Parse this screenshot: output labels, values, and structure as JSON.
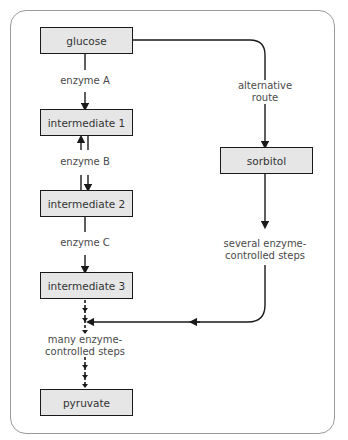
{
  "diagram": {
    "nodes": {
      "glucose": "glucose",
      "intermediate1": "intermediate 1",
      "intermediate2": "intermediate 2",
      "intermediate3": "intermediate 3",
      "pyruvate": "pyruvate",
      "sorbitol": "sorbitol"
    },
    "labels": {
      "enzymeA": "enzyme A",
      "enzymeB": "enzyme B",
      "enzymeC": "enzyme C",
      "alternative_line1": "alternative",
      "alternative_line2": "route",
      "several_line1": "several enzyme-",
      "several_line2": "controlled steps",
      "many_line1": "many enzyme-",
      "many_line2": "controlled steps"
    },
    "colors": {
      "box_fill": "#e6e6e6",
      "box_border": "#1a1a1a",
      "frame_border": "#9a9a9a",
      "text": "#4a4a4a"
    }
  }
}
